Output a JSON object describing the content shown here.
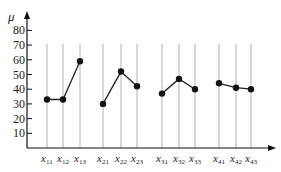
{
  "chart_data": {
    "type": "line",
    "title": "",
    "xlabel": "",
    "ylabel": "μ",
    "ylim": [
      0,
      85
    ],
    "yticks": [
      10,
      20,
      30,
      40,
      50,
      60,
      70,
      80
    ],
    "grid": "vertical lines at each category",
    "legend": "none",
    "categories": [
      "x11",
      "x12",
      "x13",
      "x21",
      "x22",
      "x23",
      "x31",
      "x32",
      "x33",
      "x41",
      "x42",
      "x43"
    ],
    "series": [
      {
        "name": "group1",
        "x": [
          "x11",
          "x12",
          "x13"
        ],
        "values": [
          33,
          33,
          59
        ]
      },
      {
        "name": "group2",
        "x": [
          "x21",
          "x22",
          "x23"
        ],
        "values": [
          30,
          52,
          42
        ]
      },
      {
        "name": "group3",
        "x": [
          "x31",
          "x32",
          "x33"
        ],
        "values": [
          37,
          47,
          40
        ]
      },
      {
        "name": "group4",
        "x": [
          "x41",
          "x42",
          "x43"
        ],
        "values": [
          44,
          41,
          40
        ]
      }
    ]
  },
  "axis": {
    "y_label": "μ",
    "ticks": [
      "10",
      "20",
      "30",
      "40",
      "50",
      "60",
      "70",
      "80"
    ],
    "x_labels": [
      {
        "base": "x",
        "sub": "11"
      },
      {
        "base": "x",
        "sub": "12"
      },
      {
        "base": "x",
        "sub": "13"
      },
      {
        "base": "x",
        "sub": "21"
      },
      {
        "base": "x",
        "sub": "22"
      },
      {
        "base": "x",
        "sub": "23"
      },
      {
        "base": "x",
        "sub": "31"
      },
      {
        "base": "x",
        "sub": "32"
      },
      {
        "base": "x",
        "sub": "33"
      },
      {
        "base": "x",
        "sub": "41"
      },
      {
        "base": "x",
        "sub": "42"
      },
      {
        "base": "x",
        "sub": "43"
      }
    ]
  },
  "colors": {
    "axis": "#111111",
    "gridline": "#b0b0b0",
    "line": "#222222",
    "marker": "#111111"
  }
}
